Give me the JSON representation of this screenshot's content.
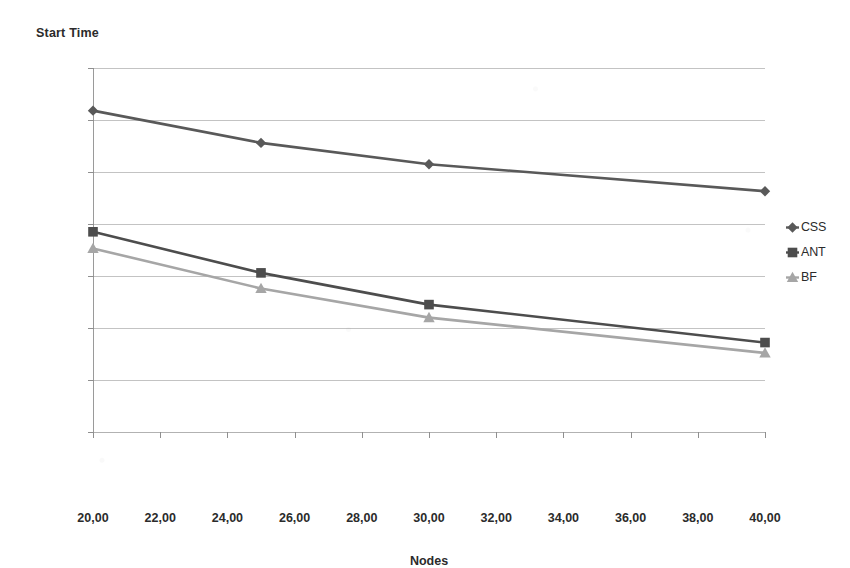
{
  "chart_data": {
    "type": "line",
    "title": "Start Time",
    "xlabel": "Nodes",
    "ylabel": "",
    "x": [
      20,
      25,
      30,
      40
    ],
    "xlim": [
      20,
      40
    ],
    "ylim": [
      0,
      700
    ],
    "grid": true,
    "legend_position": "right",
    "x_tick_labels": [
      "20,00",
      "22,00",
      "24,00",
      "26,00",
      "28,00",
      "30,00",
      "32,00",
      "34,00",
      "36,00",
      "38,00",
      "40,00"
    ],
    "x_tick_values": [
      20,
      22,
      24,
      26,
      28,
      30,
      32,
      34,
      36,
      38,
      40
    ],
    "y_tick_labels": [
      "0,00",
      "100,00",
      "200,00",
      "300,00",
      "400,00",
      "500,00",
      "600,00",
      "700,00"
    ],
    "y_tick_values": [
      0,
      100,
      200,
      300,
      400,
      500,
      600,
      700
    ],
    "series": [
      {
        "name": "CSS",
        "marker": "diamond",
        "color": "#595959",
        "values": [
          618,
          556,
          515,
          463
        ]
      },
      {
        "name": "ANT",
        "marker": "square",
        "color": "#4d4d4d",
        "values": [
          385,
          306,
          245,
          172
        ]
      },
      {
        "name": "BF",
        "marker": "triangle",
        "color": "#a6a6a6",
        "values": [
          353,
          276,
          220,
          152
        ]
      }
    ]
  },
  "legend": {
    "items": [
      {
        "label": "CSS",
        "marker": "diamond-marker-icon"
      },
      {
        "label": "ANT",
        "marker": "square-marker-icon"
      },
      {
        "label": "BF",
        "marker": "triangle-marker-icon"
      }
    ]
  },
  "colors": {
    "background": "#ffffff",
    "text": "#2b2b2b",
    "gridline": "#b9b9b9",
    "axis": "#8f8f8f",
    "series_css": "#595959",
    "series_ant": "#4d4d4d",
    "series_bf": "#a6a6a6"
  }
}
